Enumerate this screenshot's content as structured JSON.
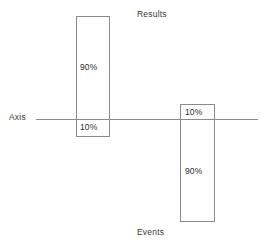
{
  "figure": {
    "background_color": "#ffffff",
    "line_color": "#8a8a8a",
    "text_color": "#2e2e2e",
    "width": 268,
    "height": 245
  },
  "axis": {
    "label": "Axis",
    "orientation": "horizontal",
    "y_position": 119
  },
  "series": [
    {
      "key": "results",
      "caption": "Results",
      "side": "above",
      "above_label": "90%",
      "below_label": "10%"
    },
    {
      "key": "events",
      "caption": "Events",
      "side": "below",
      "above_label": "10%",
      "below_label": "90%"
    }
  ],
  "chart_data": {
    "type": "bar",
    "title": "",
    "subtitle": "",
    "xlabel": "",
    "ylabel": "",
    "orientation": "vertical",
    "baseline": 0,
    "baseline_label": "Axis",
    "grid": false,
    "legend": false,
    "axis_range": [
      -100,
      100
    ],
    "unit": "%",
    "categories": [
      "Results",
      "Events"
    ],
    "annotations": [
      "Results",
      "Events",
      "Axis"
    ],
    "series": [
      {
        "name": "Above axis",
        "values": [
          90,
          10
        ],
        "labels": [
          "90%",
          "10%"
        ]
      },
      {
        "name": "Below axis",
        "values": [
          -10,
          -90
        ],
        "labels": [
          "10%",
          "90%"
        ]
      }
    ],
    "bars": [
      {
        "category": "Results",
        "above_pct": 90,
        "below_pct": 10,
        "above_label": "90%",
        "below_label": "10%"
      },
      {
        "category": "Events",
        "above_pct": 10,
        "below_pct": 90,
        "above_label": "10%",
        "below_label": "90%"
      }
    ]
  }
}
